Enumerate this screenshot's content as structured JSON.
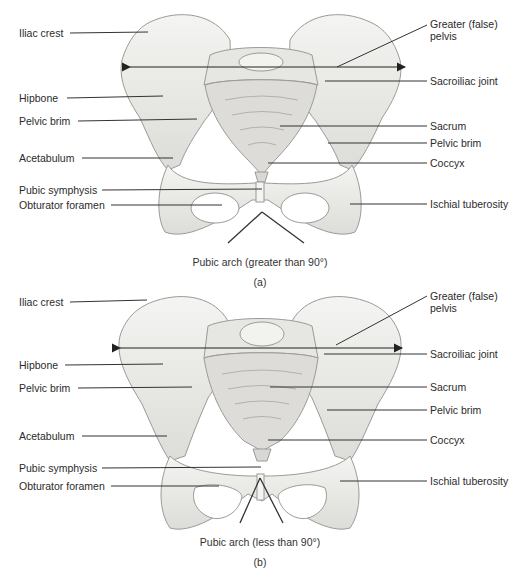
{
  "figure": {
    "panels": [
      {
        "id": "a",
        "caption": "Pubic arch (greater than 90°)",
        "panel_label": "(a)",
        "labels_left": [
          {
            "text": "Iliac crest"
          },
          {
            "text": "Hipbone"
          },
          {
            "text": "Pelvic brim"
          },
          {
            "text": "Acetabulum"
          },
          {
            "text": "Pubic symphysis"
          },
          {
            "text": "Obturator foramen"
          }
        ],
        "labels_right": [
          {
            "text": "Greater (false)",
            "text2": "pelvis"
          },
          {
            "text": "Sacroiliac joint"
          },
          {
            "text": "Sacrum"
          },
          {
            "text": "Pelvic brim"
          },
          {
            "text": "Coccyx"
          },
          {
            "text": "Ischial tuberosity"
          }
        ]
      },
      {
        "id": "b",
        "caption": "Pubic arch (less than 90°)",
        "panel_label": "(b)",
        "labels_left": [
          {
            "text": "Iliac crest"
          },
          {
            "text": "Hipbone"
          },
          {
            "text": "Pelvic brim"
          },
          {
            "text": "Acetabulum"
          },
          {
            "text": "Pubic symphysis"
          },
          {
            "text": "Obturator foramen"
          }
        ],
        "labels_right": [
          {
            "text": "Greater (false)",
            "text2": "pelvis"
          },
          {
            "text": "Sacroiliac joint"
          },
          {
            "text": "Sacrum"
          },
          {
            "text": "Pelvic brim"
          },
          {
            "text": "Coccyx"
          },
          {
            "text": "Ischial tuberosity"
          }
        ]
      }
    ]
  },
  "colors": {
    "bone_fill": "#ececea",
    "bone_shade": "#d6d6d2",
    "bone_outline": "#9a9a96",
    "leader_line": "#333333",
    "text": "#2b2b2b"
  }
}
